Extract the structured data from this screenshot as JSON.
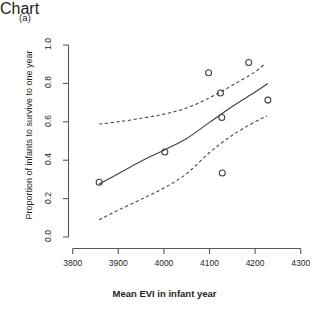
{
  "panel": {
    "label": "(a)"
  },
  "chart_data": {
    "type": "scatter",
    "title": "",
    "xlabel": "Mean EVI in infant year",
    "ylabel": "Proportion of infants to survive to one year",
    "xlim": [
      3800,
      4300
    ],
    "ylim": [
      0.0,
      1.0
    ],
    "xticks": [
      3800,
      3900,
      4000,
      4100,
      4200,
      4300
    ],
    "xtick_labels": [
      "3800",
      "3900",
      "4000",
      "4100",
      "4200",
      "4300"
    ],
    "yticks": [
      0.0,
      0.2,
      0.4,
      0.6,
      0.8,
      1.0
    ],
    "ytick_labels": [
      "0.0",
      "0.2",
      "0.4",
      "0.6",
      "0.8",
      "1.0"
    ],
    "grid": false,
    "legend": null,
    "points": [
      {
        "x": 3858,
        "y": 0.285
      },
      {
        "x": 4002,
        "y": 0.443
      },
      {
        "x": 4098,
        "y": 0.855
      },
      {
        "x": 4124,
        "y": 0.75
      },
      {
        "x": 4127,
        "y": 0.622
      },
      {
        "x": 4128,
        "y": 0.333
      },
      {
        "x": 4186,
        "y": 0.909
      },
      {
        "x": 4228,
        "y": 0.713
      }
    ],
    "fit_line": {
      "name": "fitted curve",
      "style": "solid",
      "x": [
        3858,
        3900,
        3950,
        4000,
        4050,
        4100,
        4150,
        4200,
        4228
      ],
      "y": [
        0.276,
        0.33,
        0.395,
        0.452,
        0.513,
        0.597,
        0.68,
        0.755,
        0.8
      ]
    },
    "confidence_band_upper": {
      "name": "upper 95% confidence limit",
      "style": "dashed",
      "x": [
        3858,
        3900,
        3950,
        4000,
        4050,
        4100,
        4150,
        4200,
        4222
      ],
      "y": [
        0.588,
        0.6,
        0.618,
        0.64,
        0.672,
        0.725,
        0.79,
        0.86,
        0.905
      ]
    },
    "confidence_band_lower": {
      "name": "lower 95% confidence limit",
      "style": "dashed",
      "x": [
        3858,
        3900,
        3950,
        4000,
        4050,
        4100,
        4150,
        4200,
        4226
      ],
      "y": [
        0.09,
        0.14,
        0.196,
        0.255,
        0.33,
        0.44,
        0.53,
        0.6,
        0.63
      ]
    }
  },
  "axis": {
    "tick_color": "#58595b",
    "line_color": "#58595b",
    "data_color": "#414042"
  }
}
